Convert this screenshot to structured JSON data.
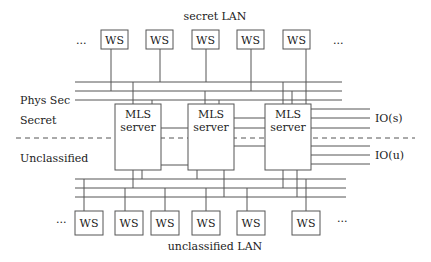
{
  "diagram": {
    "labels": {
      "secret_lan": "secret LAN",
      "unclassified_lan": "unclassified LAN",
      "phys_sec": "Phys Sec",
      "secret": "Secret",
      "unclassified": "Unclassified",
      "io_secret": "IO(s)",
      "io_unclassified": "IO(u)",
      "ellipsis": "..."
    },
    "top_workstations": [
      "WS",
      "WS",
      "WS",
      "WS",
      "WS"
    ],
    "bottom_workstations": [
      "WS",
      "WS",
      "WS",
      "WS",
      "WS",
      "WS"
    ],
    "servers": [
      {
        "line1": "MLS",
        "line2": "server"
      },
      {
        "line1": "MLS",
        "line2": "server"
      },
      {
        "line1": "MLS",
        "line2": "server"
      }
    ],
    "colors": {
      "stroke": "#555555",
      "text": "#222222"
    }
  }
}
